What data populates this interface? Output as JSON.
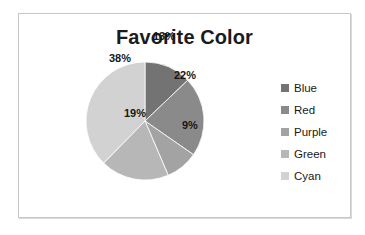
{
  "chart_data": {
    "type": "pie",
    "title": "Favorite Color",
    "categories": [
      "Blue",
      "Red",
      "Purple",
      "Green",
      "Cyan"
    ],
    "values": [
      13,
      22,
      9,
      19,
      38
    ],
    "data_labels": [
      "13%",
      "22%",
      "9%",
      "19%",
      "38%"
    ],
    "unit": "%",
    "start_angle_deg": 0,
    "direction": "clockwise",
    "legend_position": "right",
    "grid": false,
    "xlabel": "",
    "ylabel": "",
    "slice_colors": [
      "#737373",
      "#8a8a8a",
      "#a3a3a3",
      "#b7b7b7",
      "#d2d2d2"
    ],
    "label_placement": [
      "inside",
      "inside",
      "outside",
      "inside",
      "inside"
    ]
  },
  "legend": {
    "items": [
      {
        "label": "Blue",
        "swatch": "#737373"
      },
      {
        "label": "Red",
        "swatch": "#8a8a8a"
      },
      {
        "label": "Purple",
        "swatch": "#a3a3a3"
      },
      {
        "label": "Green",
        "swatch": "#b7b7b7"
      },
      {
        "label": "Cyan",
        "swatch": "#d2d2d2"
      }
    ]
  },
  "frame": {
    "border_color": "#c8c8c8",
    "background": "#ffffff"
  }
}
